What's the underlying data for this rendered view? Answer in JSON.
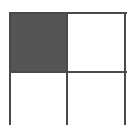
{
  "diagram": {
    "type": "grid",
    "rows": 2,
    "cols": 2,
    "cells": [
      {
        "row": 0,
        "col": 0,
        "filled": true,
        "color": "#555555"
      },
      {
        "row": 0,
        "col": 1,
        "filled": false,
        "color": "#ffffff"
      },
      {
        "row": 1,
        "col": 0,
        "filled": false,
        "color": "#ffffff"
      },
      {
        "row": 1,
        "col": 1,
        "filled": false,
        "color": "#ffffff"
      }
    ],
    "line_color": "#4a4a4a",
    "open_bottom": true
  }
}
